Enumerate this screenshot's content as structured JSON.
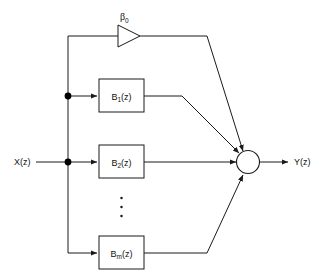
{
  "diagram": {
    "input": {
      "label": "X(z)",
      "name": "input-signal-label"
    },
    "output": {
      "label": "Y(z)",
      "name": "output-signal-label"
    },
    "gain": {
      "symbol": "β",
      "subscript": "0",
      "full_label": "β₀",
      "shape": "triangle-amplifier"
    },
    "summer": {
      "label": "",
      "shape": "circle",
      "input_count": 4
    },
    "ellipsis": "⋮",
    "blocks": [
      {
        "base": "B",
        "subscript": "1",
        "arg": "(z)",
        "label": "B₁ (z)"
      },
      {
        "base": "B",
        "subscript": "2",
        "arg": "(z)",
        "label": "B₂ (z)"
      },
      {
        "base": "B",
        "subscript": "m",
        "arg": "(z)",
        "label": "Bₘ (z)"
      }
    ],
    "colors": {
      "line": "#1a1a1a",
      "background": "#ffffff",
      "text": "#111111",
      "node": "#000000"
    }
  }
}
